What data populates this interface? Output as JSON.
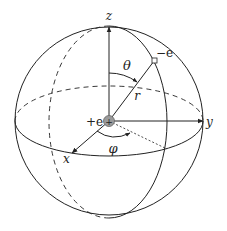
{
  "diagram": {
    "labels": {
      "z_axis": "z",
      "y_axis": "y",
      "x_axis": "x",
      "theta": "θ",
      "phi": "φ",
      "radius": "r",
      "nucleus": "+e",
      "nucleus_symbol": "+",
      "electron": "−e"
    },
    "colors": {
      "line": "#222222",
      "nucleus_fill": "#9a9a9a",
      "electron_fill": "#ffffff"
    }
  }
}
